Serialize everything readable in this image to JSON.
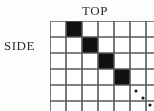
{
  "figure": {
    "type": "grid-diagram",
    "top_label": "TOP",
    "side_label": "SIDE",
    "ellipsis_symbol": "⋱"
  },
  "grid": {
    "visible_columns": 6,
    "visible_rows": 5,
    "cell_size_px": 16,
    "origin_x_px": 50,
    "origin_y_px": 21,
    "continues_right": true,
    "continues_down": true,
    "filled_color": "#111111",
    "empty_color": "#ffffff",
    "line_color": "#55585a",
    "filled_cells": [
      {
        "row": 1,
        "col": 2
      },
      {
        "row": 2,
        "col": 3
      },
      {
        "row": 3,
        "col": 4
      },
      {
        "row": 4,
        "col": 5
      }
    ],
    "pattern_description": "diagonal"
  },
  "ellipsis": {
    "dots": [
      {
        "x": 86,
        "y": 70
      },
      {
        "x": 93,
        "y": 77
      },
      {
        "x": 100,
        "y": 84
      }
    ],
    "radius_px": 1.6
  }
}
